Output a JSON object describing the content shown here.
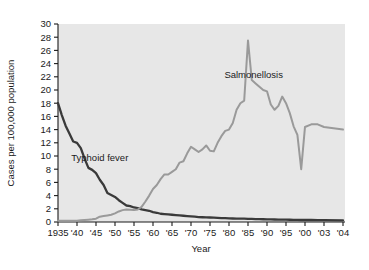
{
  "chart_data": {
    "type": "line",
    "title": "",
    "xlabel": "Year",
    "ylabel": "Cases per 100,000 population",
    "grid": false,
    "legend_position": "inline-annotations",
    "plot_background": "#e7e7e7",
    "xlim": [
      1935,
      2004
    ],
    "ylim": [
      0,
      30
    ],
    "yticks": [
      0,
      2,
      4,
      6,
      8,
      10,
      12,
      14,
      16,
      18,
      20,
      22,
      24,
      26,
      28,
      30
    ],
    "ytick_labels": [
      "0",
      "2",
      "4",
      "6",
      "8",
      "10",
      "12",
      "14",
      "16",
      "18",
      "20",
      "22",
      "24",
      "26",
      "28",
      "30"
    ],
    "xticks": [
      1935,
      1940,
      1945,
      1950,
      1955,
      1960,
      1965,
      1970,
      1975,
      1980,
      1985,
      1990,
      1995,
      2000,
      2003,
      2004
    ],
    "xtick_labels": [
      "1935",
      "'40",
      "'45",
      "'50",
      "'55",
      "'60",
      "'65",
      "'70",
      "'75",
      "'80",
      "'85",
      "'90",
      "'95",
      "'00",
      "'03",
      "'04"
    ],
    "annotations": [
      {
        "text": "Typhoid fever",
        "x": 1946,
        "y": 9.2
      },
      {
        "text": "Salmonellosis",
        "x": 1986.5,
        "y": 21.8
      }
    ],
    "series": [
      {
        "name": "Typhoid fever",
        "color": "#3a3a3a",
        "width": 2.3,
        "x": [
          1935,
          1936,
          1937,
          1938,
          1939,
          1940,
          1941,
          1942,
          1943,
          1944,
          1945,
          1946,
          1947,
          1948,
          1949,
          1950,
          1951,
          1952,
          1953,
          1954,
          1955,
          1956,
          1957,
          1958,
          1959,
          1960,
          1961,
          1962,
          1963,
          1964,
          1965,
          1966,
          1967,
          1968,
          1969,
          1970,
          1971,
          1972,
          1973,
          1974,
          1975,
          1976,
          1977,
          1978,
          1979,
          1980,
          1981,
          1982,
          1983,
          1984,
          1985,
          1986,
          1987,
          1988,
          1989,
          1990,
          1991,
          1992,
          1993,
          1994,
          1995,
          1996,
          1997,
          1998,
          1999,
          2000,
          2001,
          2002,
          2003,
          2004
        ],
        "values": [
          18.0,
          16.2,
          14.6,
          13.4,
          12.2,
          12.0,
          11.2,
          9.6,
          8.2,
          7.9,
          7.4,
          6.4,
          5.6,
          4.4,
          4.1,
          3.8,
          3.3,
          2.9,
          2.5,
          2.4,
          2.2,
          2.1,
          1.9,
          1.8,
          1.7,
          1.5,
          1.4,
          1.25,
          1.2,
          1.15,
          1.1,
          1.05,
          1.0,
          0.95,
          0.9,
          0.85,
          0.8,
          0.75,
          0.72,
          0.7,
          0.68,
          0.65,
          0.62,
          0.6,
          0.58,
          0.55,
          0.53,
          0.52,
          0.5,
          0.5,
          0.48,
          0.46,
          0.45,
          0.44,
          0.42,
          0.4,
          0.4,
          0.38,
          0.37,
          0.36,
          0.35,
          0.34,
          0.33,
          0.32,
          0.3,
          0.3,
          0.3,
          0.28,
          0.28,
          0.25
        ]
      },
      {
        "name": "Salmonellosis",
        "color": "#9a9a9a",
        "width": 2.0,
        "x": [
          1935,
          1936,
          1937,
          1938,
          1939,
          1940,
          1941,
          1942,
          1943,
          1944,
          1945,
          1946,
          1947,
          1948,
          1949,
          1950,
          1951,
          1952,
          1953,
          1954,
          1955,
          1956,
          1957,
          1958,
          1959,
          1960,
          1961,
          1962,
          1963,
          1964,
          1965,
          1966,
          1967,
          1968,
          1969,
          1970,
          1971,
          1972,
          1973,
          1974,
          1975,
          1976,
          1977,
          1978,
          1979,
          1980,
          1981,
          1982,
          1983,
          1984,
          1985,
          1986,
          1987,
          1988,
          1989,
          1990,
          1991,
          1992,
          1993,
          1994,
          1995,
          1996,
          1997,
          1998,
          1999,
          2000,
          2001,
          2002,
          2003,
          2004
        ],
        "values": [
          0.2,
          0.2,
          0.2,
          0.2,
          0.2,
          0.2,
          0.25,
          0.3,
          0.35,
          0.4,
          0.5,
          0.8,
          0.9,
          1.0,
          1.1,
          1.3,
          1.6,
          1.8,
          1.9,
          1.85,
          1.8,
          1.9,
          2.3,
          3.1,
          4.0,
          5.0,
          5.6,
          6.5,
          7.2,
          7.2,
          7.6,
          8.0,
          9.0,
          9.2,
          10.4,
          11.4,
          11.0,
          10.6,
          11.0,
          11.6,
          10.8,
          10.7,
          12.0,
          13.0,
          13.8,
          14.0,
          15.0,
          17.0,
          18.0,
          18.4,
          27.5,
          21.5,
          21.0,
          20.5,
          20.0,
          19.8,
          17.8,
          17.0,
          17.6,
          19.0,
          18.0,
          16.5,
          14.5,
          13.2,
          8.0,
          14.4,
          14.8,
          14.8,
          14.4,
          14.0
        ]
      }
    ]
  },
  "axis": {
    "ylabel": "Cases per 100,000 population",
    "xlabel": "Year"
  }
}
